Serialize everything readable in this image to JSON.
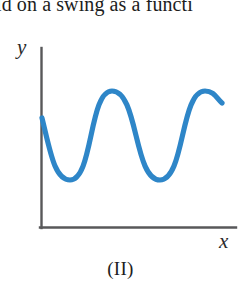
{
  "page": {
    "width": 241,
    "height": 286,
    "background": "#ffffff"
  },
  "clipped_text": {
    "text": "ld on a swing as a functi",
    "note": "partial line of body text cropped at top edge"
  },
  "figure": {
    "caption": "(II)",
    "axis": {
      "x_label": "x",
      "y_label": "y",
      "color": "#58585a",
      "origin": {
        "x": 41,
        "y": 228
      },
      "y_top": 48,
      "x_right": 236
    },
    "curve": {
      "color": "#2e86c8",
      "stroke_width": 5.2
    }
  },
  "chart_data": {
    "type": "line",
    "title": "",
    "xlabel": "x",
    "ylabel": "y",
    "grid": false,
    "legend": null,
    "axis_style": "bare-l-axes-no-ticks",
    "xlim": [
      41,
      236
    ],
    "ylim": [
      228,
      48
    ],
    "amplitude_px": 45,
    "period_px": 93,
    "series": [
      {
        "name": "displacement",
        "points": [
          {
            "x": 42,
            "y": 118,
            "kind": "start"
          },
          {
            "x": 70,
            "y": 180,
            "kind": "trough"
          },
          {
            "x": 112,
            "y": 91,
            "kind": "crest"
          },
          {
            "x": 160,
            "y": 180,
            "kind": "trough"
          },
          {
            "x": 205,
            "y": 91,
            "kind": "crest"
          },
          {
            "x": 222,
            "y": 103,
            "kind": "end"
          }
        ]
      }
    ],
    "crest_y": 91,
    "trough_y": 180,
    "crests_x": [
      112,
      205
    ],
    "troughs_x": [
      70,
      160
    ]
  }
}
